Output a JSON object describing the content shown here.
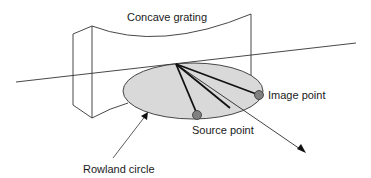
{
  "diagram": {
    "labels": {
      "grating": "Concave grating",
      "image_point": "Image point",
      "source_point": "Source point",
      "rowland_circle": "Rowland circle"
    },
    "colors": {
      "circle_fill": "#d9d9d9",
      "point_fill": "#808080",
      "stroke": "#222222"
    }
  }
}
